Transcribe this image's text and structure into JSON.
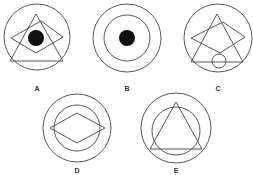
{
  "colors": {
    "stroke": "#444444",
    "fill_dot": "#111111",
    "label": "#333333",
    "background": "#ffffff"
  },
  "figures": [
    {
      "label": "A",
      "label_pos": [
        37,
        85
      ],
      "elements": [
        {
          "type": "circle",
          "cx": 37,
          "cy": 37,
          "r": 33
        },
        {
          "type": "polygon",
          "points": "36,14 10,61 63,61"
        },
        {
          "type": "polygon",
          "points": "11,38 41,21 63,37 36,53"
        },
        {
          "type": "dot",
          "cx": 36,
          "cy": 38,
          "r": 8
        }
      ]
    },
    {
      "label": "B",
      "label_pos": [
        127,
        85
      ],
      "elements": [
        {
          "type": "circle",
          "cx": 127,
          "cy": 38,
          "r": 34
        },
        {
          "type": "circle",
          "cx": 127,
          "cy": 38,
          "r": 23
        },
        {
          "type": "dot",
          "cx": 127,
          "cy": 38,
          "r": 8
        }
      ]
    },
    {
      "label": "C",
      "label_pos": [
        218,
        85
      ],
      "elements": [
        {
          "type": "circle",
          "cx": 218,
          "cy": 38,
          "r": 34
        },
        {
          "type": "polygon",
          "points": "217,14 191,62 243,62"
        },
        {
          "type": "polygon",
          "points": "191,38 223,22 245,37 220,53"
        },
        {
          "type": "circle",
          "cx": 219,
          "cy": 61,
          "r": 7
        }
      ]
    },
    {
      "label": "D",
      "label_pos": [
        77,
        167
      ],
      "elements": [
        {
          "type": "circle",
          "cx": 77,
          "cy": 128,
          "r": 34
        },
        {
          "type": "circle",
          "cx": 77,
          "cy": 128,
          "r": 23
        },
        {
          "type": "polygon",
          "points": "50,128 77,113 105,128 77,143"
        }
      ]
    },
    {
      "label": "E",
      "label_pos": [
        176,
        167
      ],
      "elements": [
        {
          "type": "circle",
          "cx": 176,
          "cy": 128,
          "r": 35
        },
        {
          "type": "circle",
          "cx": 176,
          "cy": 131,
          "r": 24
        },
        {
          "type": "polygon",
          "points": "176,102 150,149 202,149"
        }
      ]
    }
  ]
}
